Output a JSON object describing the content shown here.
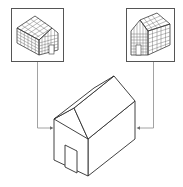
{
  "diagram": {
    "background_color": "#ffffff",
    "stroke_color": "#2e2e2e",
    "connector_color": "#8a8a8a",
    "nodes": [
      {
        "id": "left-inset",
        "type": "inset-box",
        "content": "gridded-house-model",
        "view": "left-facing"
      },
      {
        "id": "right-inset",
        "type": "inset-box",
        "content": "gridded-house-model",
        "view": "right-facing"
      },
      {
        "id": "center-house",
        "type": "isometric-line-drawing",
        "content": "house-with-gable-roof-and-door"
      }
    ],
    "edges": [
      {
        "from": "left-inset",
        "to": "center-house",
        "arrow": "right"
      },
      {
        "from": "right-inset",
        "to": "center-house",
        "arrow": "left"
      }
    ],
    "labels": []
  }
}
